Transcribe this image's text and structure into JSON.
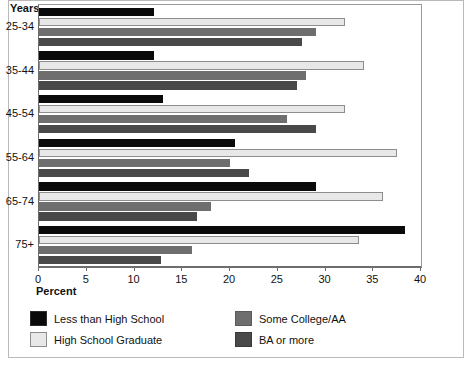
{
  "chart_data": {
    "type": "bar",
    "orientation": "horizontal",
    "title": "",
    "xlabel": "Percent",
    "ylabel": "Years",
    "xlim": [
      0,
      40
    ],
    "xticks": [
      0,
      5,
      10,
      15,
      20,
      25,
      30,
      35,
      40
    ],
    "grid": false,
    "legend_position": "bottom-left",
    "categories": [
      "25-34",
      "35-44",
      "45-54",
      "55-64",
      "65-74",
      "75+"
    ],
    "series": [
      {
        "name": "Less than High School",
        "color": "#0a0a0a",
        "values": [
          12.0,
          12.0,
          13.0,
          20.5,
          29.0,
          38.3
        ]
      },
      {
        "name": "High School Graduate",
        "color": "#e8e8e8",
        "values": [
          32.0,
          34.0,
          32.0,
          37.5,
          36.0,
          33.5
        ]
      },
      {
        "name": "Some College/AA",
        "color": "#6e6e6e",
        "values": [
          29.0,
          28.0,
          26.0,
          20.0,
          18.0,
          16.0
        ]
      },
      {
        "name": "BA or more",
        "color": "#494949",
        "values": [
          27.5,
          27.0,
          29.0,
          22.0,
          16.5,
          12.8
        ]
      }
    ]
  },
  "axes": {
    "y_title": "Years",
    "x_title": "Percent"
  },
  "legend": {
    "items": [
      {
        "label": "Less than High School",
        "swatch": "s0"
      },
      {
        "label": "High School Graduate",
        "swatch": "s1"
      },
      {
        "label": "Some College/AA",
        "swatch": "s2"
      },
      {
        "label": "BA or more",
        "swatch": "s3"
      }
    ]
  }
}
